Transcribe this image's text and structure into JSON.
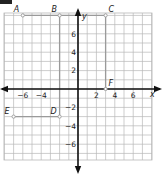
{
  "figure": {
    "type": "coordinate-plane",
    "x_axis_label": "x",
    "y_axis_label": "y",
    "range": {
      "xmin": -8,
      "xmax": 8,
      "ymin": -8,
      "ymax": 8
    },
    "x_tick_labels": [
      {
        "value": -6,
        "text": "−6"
      },
      {
        "value": -4,
        "text": "−4"
      },
      {
        "value": 2,
        "text": "2"
      },
      {
        "value": 4,
        "text": "4"
      },
      {
        "value": 6,
        "text": "6"
      }
    ],
    "y_tick_labels": [
      {
        "value": 6,
        "text": "6"
      },
      {
        "value": 4,
        "text": "4"
      },
      {
        "value": 2,
        "text": "2"
      },
      {
        "value": -2,
        "text": "−2"
      },
      {
        "value": -4,
        "text": "−4"
      },
      {
        "value": -6,
        "text": "−6"
      }
    ],
    "points": [
      {
        "name": "A",
        "x": -6,
        "y": 8
      },
      {
        "name": "B",
        "x": -2,
        "y": 8
      },
      {
        "name": "C",
        "x": 3,
        "y": 8
      },
      {
        "name": "D",
        "x": -2,
        "y": -3
      },
      {
        "name": "E",
        "x": -7,
        "y": -3
      },
      {
        "name": "F",
        "x": 3,
        "y": 0
      }
    ],
    "segments": [
      [
        "A",
        "C"
      ],
      [
        "B",
        "D"
      ],
      [
        "E",
        "D"
      ],
      [
        "C",
        "F"
      ]
    ],
    "colors": {
      "grid": "#b8b8b8",
      "axis": "#111111",
      "segment": "#9a9a9a"
    }
  }
}
